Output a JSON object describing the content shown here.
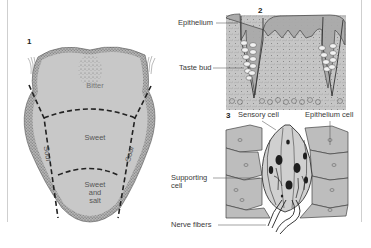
{
  "figure": {
    "panels": [
      {
        "number": "1",
        "subject": "tongue-taste-map",
        "zones": {
          "bitter": "Bitter",
          "sweet": "Sweet",
          "sour_left": "Sour",
          "sour_right": "Sour",
          "sweet_salt_line1": "Sweet",
          "sweet_salt_line2": "and",
          "sweet_salt_line3": "salt"
        }
      },
      {
        "number": "2",
        "subject": "papilla-section",
        "labels": {
          "epithelium": "Epithelium",
          "taste_bud": "Taste bud"
        }
      },
      {
        "number": "3",
        "subject": "taste-bud-detail",
        "labels": {
          "sensory_cell": "Sensory cell",
          "epithelium_cell": "Epithelium cell",
          "supporting_line1": "Supporting",
          "supporting_line2": "cell",
          "nerve_fibers": "Nerve fibers"
        }
      }
    ],
    "colors": {
      "tissue": "#c4c4c4",
      "tissue_dark": "#9a9a9a",
      "outline": "#444444",
      "stipple": "#6e6e6e",
      "frame": "#cfcfcf"
    }
  }
}
